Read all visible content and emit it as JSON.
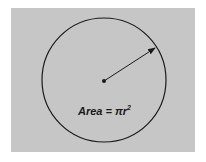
{
  "diagram": {
    "formula": {
      "prefix": "Area = πr",
      "exponent": "2"
    },
    "colors": {
      "background": "#c6c6c6",
      "stroke": "#1a1a1a"
    }
  }
}
